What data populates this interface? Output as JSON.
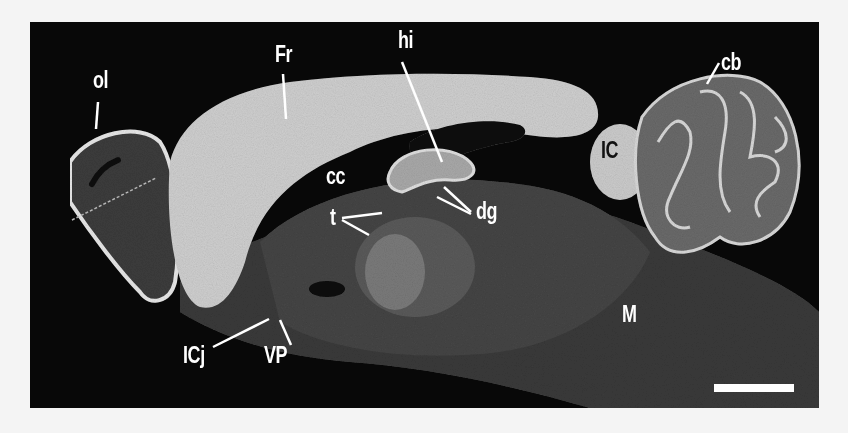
{
  "figure": {
    "type": "sagittal brain section micrograph",
    "background_color": "#080808",
    "label_color": "#ffffff",
    "labels": [
      {
        "id": "ol",
        "text": "ol",
        "x": 63,
        "y": 47
      },
      {
        "id": "Fr",
        "text": "Fr",
        "x": 245,
        "y": 21
      },
      {
        "id": "hi",
        "text": "hi",
        "x": 368,
        "y": 7
      },
      {
        "id": "cb",
        "text": "cb",
        "x": 691,
        "y": 29
      },
      {
        "id": "IC",
        "text": "IC",
        "x": 571,
        "y": 117
      },
      {
        "id": "cc",
        "text": "cc",
        "x": 296,
        "y": 143
      },
      {
        "id": "t",
        "text": "t",
        "x": 300,
        "y": 184
      },
      {
        "id": "dg",
        "text": "dg",
        "x": 446,
        "y": 178
      },
      {
        "id": "M",
        "text": "M",
        "x": 592,
        "y": 281
      },
      {
        "id": "ICj",
        "text": "ICj",
        "x": 153,
        "y": 322
      },
      {
        "id": "VP",
        "text": "VP",
        "x": 234,
        "y": 322
      }
    ],
    "scale_bar": {
      "x": 684,
      "y": 362,
      "width": 80,
      "height": 8,
      "color": "#ffffff"
    }
  }
}
